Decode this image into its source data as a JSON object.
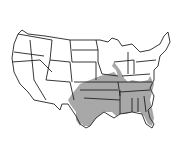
{
  "map": {
    "region": "Contiguous United States",
    "style": "state outline map with shaded distribution range",
    "colors": {
      "background": "#ffffff",
      "outline": "#222222",
      "range_fill": "#a8a8a8"
    },
    "shaded_range": {
      "description": "Southeastern and south-central United States",
      "states_fully_shaded": [
        "Oklahoma",
        "Arkansas",
        "Louisiana",
        "Mississippi",
        "Alabama",
        "Georgia",
        "Florida",
        "South Carolina",
        "Tennessee"
      ],
      "states_partially_shaded": [
        "Texas",
        "Kansas",
        "Missouri",
        "Illinois",
        "Indiana",
        "Kentucky",
        "North Carolina",
        "Iowa"
      ]
    }
  }
}
